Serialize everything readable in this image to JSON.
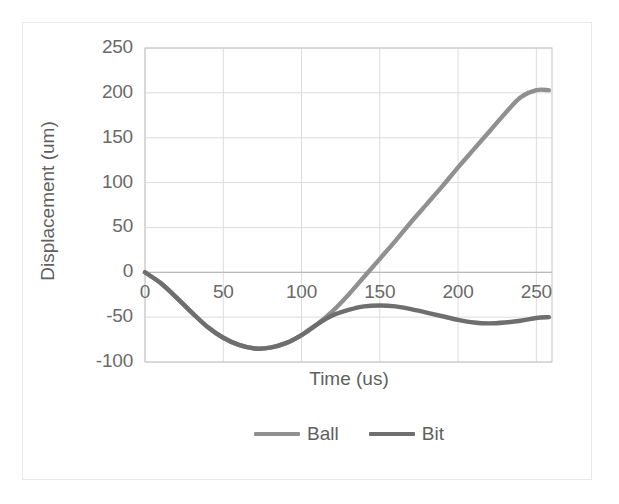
{
  "chart_data": {
    "type": "line",
    "title": "",
    "xlabel": "Time (us)",
    "ylabel": "Displacement (um)",
    "xlim": [
      0,
      260
    ],
    "ylim": [
      -100,
      250
    ],
    "xticks": [
      "0",
      "50",
      "100",
      "150",
      "200",
      "250"
    ],
    "yticks": [
      "250",
      "200",
      "150",
      "100",
      "50",
      "0",
      "-50",
      "-100"
    ],
    "grid": true,
    "legend_position": "bottom-center",
    "x": [
      0,
      10,
      20,
      30,
      40,
      50,
      60,
      70,
      80,
      90,
      100,
      110,
      120,
      130,
      140,
      150,
      160,
      170,
      180,
      190,
      200,
      210,
      220,
      230,
      240,
      250,
      258
    ],
    "series": [
      {
        "name": "Ball",
        "color": "#909090",
        "values": [
          0,
          -12,
          -28,
          -45,
          -61,
          -73,
          -81,
          -85,
          -84,
          -79,
          -70,
          -58,
          -43,
          -25,
          -5,
          15,
          35,
          56,
          76,
          96,
          117,
          137,
          157,
          177,
          195,
          203,
          203
        ]
      },
      {
        "name": "Bit",
        "color": "#6e6e6e",
        "values": [
          0,
          -12,
          -28,
          -45,
          -61,
          -73,
          -81,
          -85,
          -84,
          -79,
          -70,
          -58,
          -48,
          -42,
          -38,
          -37,
          -38,
          -41,
          -45,
          -49,
          -53,
          -56,
          -57,
          -56,
          -54,
          -51,
          -50
        ]
      }
    ]
  },
  "legend": {
    "items": [
      {
        "label": "Ball",
        "color": "#909090"
      },
      {
        "label": "Bit",
        "color": "#6e6e6e"
      }
    ]
  },
  "axes": {
    "y": {
      "label": "Displacement (um)",
      "ticks": [
        "250",
        "200",
        "150",
        "100",
        "50",
        "0",
        "-50",
        "-100"
      ]
    },
    "x": {
      "label": "Time (us)",
      "ticks": [
        "0",
        "50",
        "100",
        "150",
        "200",
        "250"
      ]
    }
  },
  "style": {
    "gridline_color": "#dcdcdc",
    "axis_line_color": "#c4c4c4",
    "tick_text_color": "#6a6a6a",
    "background": "#ffffff"
  }
}
